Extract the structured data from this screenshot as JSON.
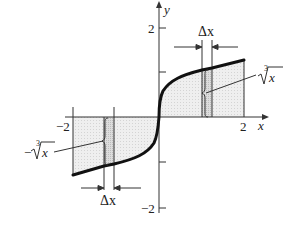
{
  "diagram": {
    "axes": {
      "x_label": "x",
      "y_label": "y",
      "x_ticks": {
        "neg": "−2",
        "pos": "2"
      },
      "y_ticks": {
        "pos": "2",
        "neg": "−2"
      }
    },
    "curve_label_right": "∛x",
    "curve_label_right_index": "3",
    "curve_label_right_radicand": "x",
    "curve_label_left_prefix": "−",
    "curve_label_left_index": "3",
    "curve_label_left_radicand": "x",
    "delta_label_top": "Δx",
    "delta_label_bottom": "Δx",
    "colors": {
      "curve": "#111111",
      "shade": "#ececec",
      "strip": "#d6d6d6",
      "axis": "#333333"
    }
  }
}
